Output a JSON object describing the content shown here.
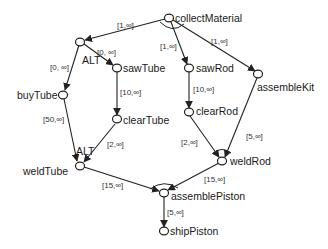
{
  "nodes": {
    "collectMaterial": {
      "label": "collectMaterial"
    },
    "sawTube": {
      "label": "sawTube"
    },
    "buyTube": {
      "label": "buyTube"
    },
    "clearTube": {
      "label": "clearTube"
    },
    "weldTube": {
      "label": "weldTube"
    },
    "sawRod": {
      "label": "sawRod"
    },
    "clearRod": {
      "label": "clearRod"
    },
    "assembleKit": {
      "label": "assembleKit"
    },
    "weldRod": {
      "label": "weldRod"
    },
    "assemblePiston": {
      "label": "assemblePiston"
    },
    "shipPiston": {
      "label": "shipPiston"
    }
  },
  "alt_labels": {
    "split": "ALT",
    "join": "ALT"
  },
  "edges": {
    "collect_to_alt": "[1,∞]",
    "alt_to_buyTube": "[0, ∞]",
    "alt_to_sawTube": "[0, ∞]",
    "sawTube_to_clearTube": "[10,∞]",
    "buyTube_to_weldTube": "[50,∞]",
    "clearTube_to_weldTube": "[2,∞]",
    "collect_to_sawRod": "[1,∞]",
    "collect_to_assembleKit": "[1,∞]",
    "sawRod_to_clearRod": "[10,∞]",
    "clearRod_to_weldRod": "[2,∞]",
    "assembleKit_to_weldRod": "[5,∞]",
    "weldTube_to_assemblePiston": "[15,∞]",
    "weldRod_to_assemblePiston": "[15,∞]",
    "assemblePiston_to_shipPiston": "[5,∞]"
  }
}
